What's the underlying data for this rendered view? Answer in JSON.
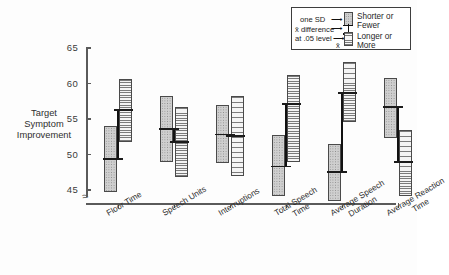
{
  "chart_data": {
    "type": "bar",
    "title": "",
    "xlabel": "",
    "ylabel": "Target Symptom Improvement",
    "ylim": [
      43,
      65
    ],
    "yticks": [
      45,
      50,
      55,
      60,
      65
    ],
    "axis_break": true,
    "grid": false,
    "legend_position": "top-right",
    "categories": [
      "Floor Time",
      "Speech Units",
      "Interruptions",
      "Total Speech\nTime",
      "Average Speech\nDuration",
      "Average Reaction\nTime"
    ],
    "series": [
      {
        "name": "Shorter or Fewer",
        "means": [
          49.4,
          53.6,
          52.8,
          48.3,
          47.5,
          56.7
        ],
        "sd_low": [
          44.7,
          48.9,
          48.8,
          44.2,
          43.4,
          52.3
        ],
        "sd_high": [
          54.0,
          58.2,
          57.0,
          52.7,
          51.5,
          60.8
        ]
      },
      {
        "name": "Longer or More",
        "means": [
          56.3,
          51.8,
          52.6,
          57.1,
          58.7,
          48.9
        ],
        "sd_low": [
          51.8,
          46.8,
          47.0,
          48.9,
          54.6,
          44.2
        ],
        "sd_high": [
          60.6,
          56.7,
          58.2,
          61.2,
          63.0,
          53.4
        ]
      }
    ],
    "significant_difference": [
      true,
      true,
      true,
      true,
      true,
      true
    ],
    "annotations": {
      "sd_note": "one SD",
      "mean_note": "x̄",
      "diff_note_line1": "x̄ difference",
      "diff_note_line2": "at .05 level"
    }
  },
  "legend": {
    "sd_label": "one SD",
    "diff_label_line1": "x̄ difference",
    "diff_label_line2": "at  .05 level",
    "mean_label": "x̄",
    "shorter_label": "Shorter or\nFewer",
    "longer_label": "Longer or\nMore"
  },
  "ticks": {
    "y": [
      "65",
      "60",
      "55",
      "50",
      "45"
    ],
    "break_glyph": "≈"
  },
  "colors": {
    "axis": "#5a5a5a",
    "ink": "#1b1b1b",
    "shorter_fill": "#cfcfcf",
    "longer_fill": "#f4f4f4",
    "background": "#fdfdfd"
  }
}
